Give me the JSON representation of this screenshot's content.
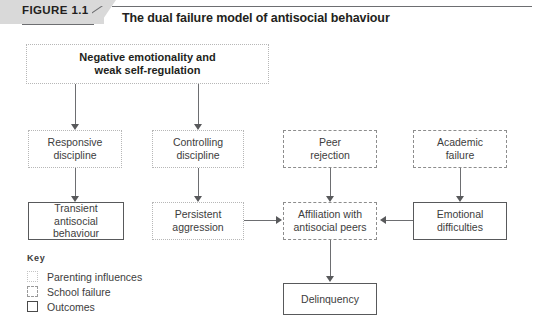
{
  "header": {
    "figure_number": "FIGURE 1.1",
    "title": "The dual failure model of antisocial behaviour"
  },
  "nodes": {
    "root": "Negative emotionality and weak self-regulation",
    "responsive_discipline": "Responsive discipline",
    "controlling_discipline": "Controlling discipline",
    "peer_rejection": "Peer rejection",
    "academic_failure": "Academic failure",
    "transient": "Transient antisocial behaviour",
    "persistent_aggression": "Persistent aggression",
    "affiliation": "Affiliation with antisocial peers",
    "emotional_difficulties": "Emotional difficulties",
    "delinquency": "Delinquency"
  },
  "node_lines": {
    "root_line1": "Negative emotionality and",
    "root_line2": "weak self-regulation",
    "responsive_line1": "Responsive",
    "responsive_line2": "discipline",
    "controlling_line1": "Controlling",
    "controlling_line2": "discipline",
    "peer_line1": "Peer",
    "peer_line2": "rejection",
    "academic_line1": "Academic",
    "academic_line2": "failure",
    "transient_line1": "Transient",
    "transient_line2": "antisocial behaviour",
    "persistent_line1": "Persistent",
    "persistent_line2": "aggression",
    "affiliation_line1": "Affiliation with",
    "affiliation_line2": "antisocial peers",
    "emotional_line1": "Emotional",
    "emotional_line2": "difficulties",
    "delinquency_line1": "Delinquency"
  },
  "key": {
    "title": "Key",
    "items": [
      {
        "label": "Parenting influences",
        "style": "dotted",
        "color": "#c4c4c4"
      },
      {
        "label": "School failure",
        "style": "dashed",
        "color": "#9a9a9a"
      },
      {
        "label": "Outcomes",
        "style": "solid",
        "color": "#4a4a4a"
      }
    ]
  },
  "colors": {
    "header_band": "#d9d9d9",
    "rule": "#6d6e71",
    "text": "#231f20",
    "node_text": "#3d3d3d",
    "connector": "#6d6e71"
  }
}
